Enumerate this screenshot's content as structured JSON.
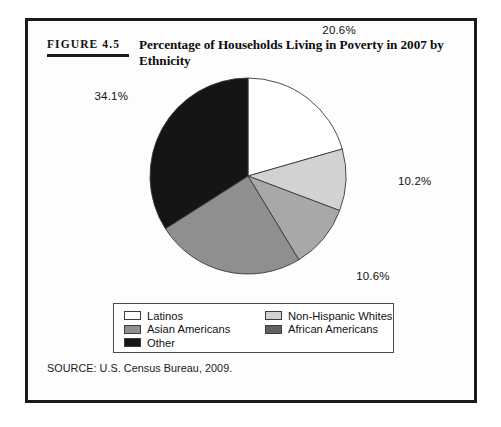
{
  "figure": {
    "number": "Figure 4.5",
    "title": "Percentage of Households Living in Poverty in 2007 by Ethnicity",
    "source": "SOURCE: U.S. Census Bureau, 2009."
  },
  "legend": {
    "items": [
      {
        "label": "Latinos",
        "color": "#ffffff"
      },
      {
        "label": "Non-Hispanic Whites",
        "color": "#d2d2d2"
      },
      {
        "label": "Asian Americans",
        "color": "#8f8f8f"
      },
      {
        "label": "African Americans",
        "color": "#626262"
      },
      {
        "label": "Other",
        "color": "#151515"
      }
    ]
  },
  "chart_data": {
    "type": "pie",
    "title": "Percentage of Households Living in Poverty in 2007 by Ethnicity",
    "categories": [
      "Latinos",
      "Non-Hispanic Whites",
      "African Americans",
      "Asian Americans",
      "Other"
    ],
    "values": [
      20.6,
      10.2,
      10.6,
      24.7,
      34.1
    ],
    "labels": [
      "20.6%",
      "10.2%",
      "10.6%",
      "24.7%",
      "34.1%"
    ],
    "colors": [
      "#ffffff",
      "#d2d2d2",
      "#a8a8a8",
      "#8f8f8f",
      "#151515"
    ],
    "start_angle_deg": 0,
    "direction": "clockwise",
    "units": "percent",
    "legend_position": "bottom",
    "grid": false
  }
}
